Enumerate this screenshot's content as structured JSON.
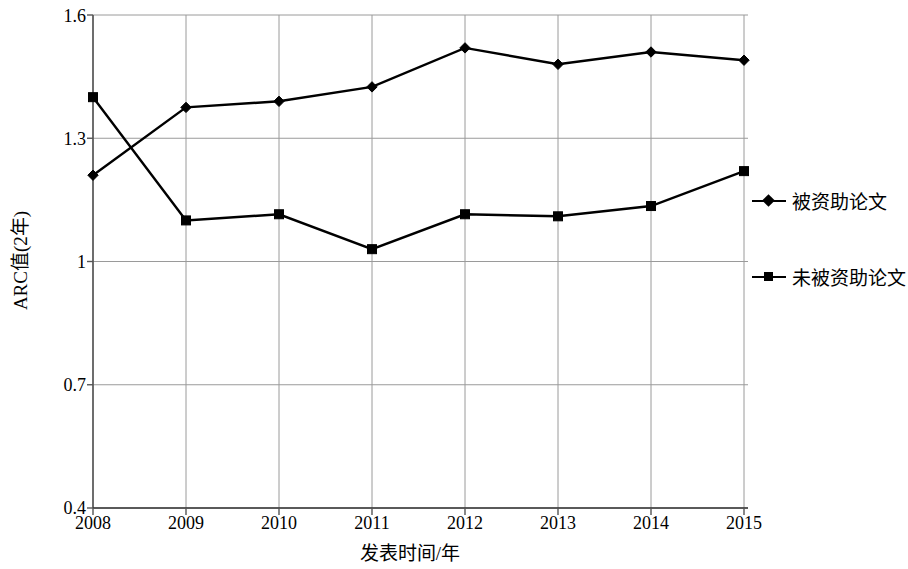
{
  "chart_data": {
    "type": "line",
    "title": "",
    "xlabel": "发表时间/年",
    "ylabel": "ARC值(2年)",
    "categories": [
      "2008",
      "2009",
      "2010",
      "2011",
      "2012",
      "2013",
      "2014",
      "2015"
    ],
    "x": [
      2008,
      2009,
      2010,
      2011,
      2012,
      2013,
      2014,
      2015
    ],
    "ylim": [
      0.4,
      1.6
    ],
    "yticks": [
      "0.4",
      "0.7",
      "1",
      "1.3",
      "1.6"
    ],
    "ytick_values": [
      0.4,
      0.7,
      1.0,
      1.3,
      1.6
    ],
    "grid": true,
    "legend_position": "right",
    "series": [
      {
        "name": "被资助论文",
        "marker": "diamond",
        "color": "#000000",
        "values": [
          1.21,
          1.375,
          1.39,
          1.425,
          1.52,
          1.48,
          1.51,
          1.49
        ]
      },
      {
        "name": "未被资助论文",
        "marker": "square",
        "color": "#000000",
        "values": [
          1.4,
          1.1,
          1.115,
          1.03,
          1.115,
          1.11,
          1.135,
          1.22
        ]
      }
    ]
  },
  "axes": {
    "y_title": "ARC值(2年)",
    "x_title": "发表时间/年"
  },
  "legend": {
    "items": [
      {
        "label": "被资助论文",
        "marker": "diamond"
      },
      {
        "label": "未被资助论文",
        "marker": "square"
      }
    ]
  },
  "colors": {
    "line": "#000000",
    "grid": "#9a9a9a",
    "axis": "#555555",
    "background": "#ffffff"
  }
}
